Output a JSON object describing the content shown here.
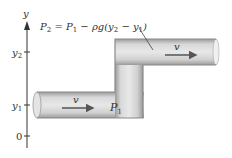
{
  "diagram": {
    "axis": {
      "label": "y",
      "ticks": [
        {
          "label_main": "y",
          "label_sub": "2",
          "y": 52
        },
        {
          "label_main": "y",
          "label_sub": "1",
          "y": 105
        },
        {
          "label_main": "0",
          "label_sub": "",
          "y": 136
        }
      ]
    },
    "equation": {
      "p2": "P",
      "p2_sub": "2",
      "eq": " = ",
      "p1": "P",
      "p1_sub": "1",
      "rest1": " − ρg(y",
      "y2_sub": "2",
      "minus": " − y",
      "y1_sub": "1",
      "close": ")"
    },
    "upper_pipe": {
      "velocity_label": "v"
    },
    "lower_pipe": {
      "velocity_label": "v",
      "pressure_main": "P",
      "pressure_sub": "1"
    },
    "colors": {
      "pipe_fill": "#c8c8c8",
      "pipe_edge": "#8a8a8a",
      "pipe_highlight": "#e6e6e6",
      "axis": "#333333",
      "arrow": "#555555"
    }
  }
}
